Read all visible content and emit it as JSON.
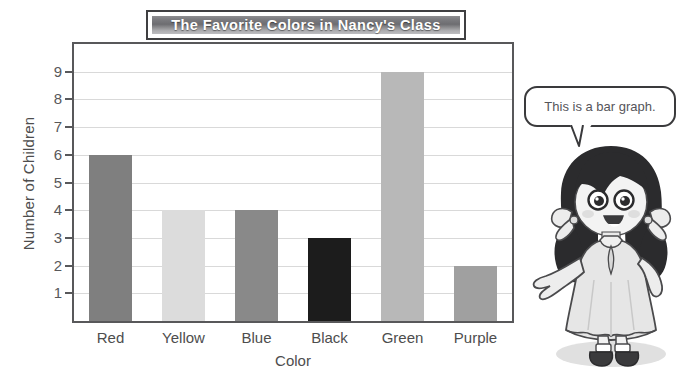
{
  "chart_data": {
    "type": "bar",
    "title": "The Favorite Colors in Nancy's Class",
    "xlabel": "Color",
    "ylabel": "Number of Children",
    "categories": [
      "Red",
      "Yellow",
      "Blue",
      "Black",
      "Green",
      "Purple"
    ],
    "values": [
      6,
      4,
      4,
      3,
      9,
      2
    ],
    "yticks": [
      9,
      8,
      7,
      6,
      5,
      4,
      3,
      2,
      1
    ],
    "ylim": [
      0,
      10
    ],
    "grid": true,
    "legend": "none",
    "bar_colors": [
      "#7f7f7f",
      "#dcdcdc",
      "#898989",
      "#1c1c1c",
      "#b8b8b8",
      "#a0a0a0"
    ],
    "series": [
      {
        "name": "Number of Children",
        "values": [
          6,
          4,
          4,
          3,
          9,
          2
        ]
      }
    ]
  },
  "banner": {
    "text": "The Favorite Colors in Nancy's Class"
  },
  "callout": {
    "text": "This is a bar graph."
  },
  "axis": {
    "x_title": "Color",
    "y_title": "Number of Children"
  },
  "colors": {
    "frame": "#58585a",
    "grid": "#d9d9d9",
    "text": "#4d4d4d",
    "banner_border": "#3f3f41",
    "bubble_border": "#3a3a3c",
    "hair": "#2b2b2d",
    "dress": "#e3e3e3",
    "skin": "#f2f2f2",
    "shoe": "#3a3a3c"
  },
  "character": {
    "name": "nancy-illustration"
  }
}
